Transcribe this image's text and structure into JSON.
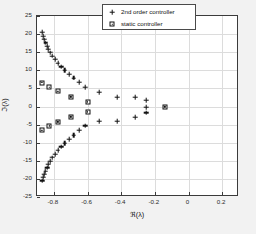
{
  "chart_data": {
    "type": "scatter",
    "title": "",
    "xlabel": "ℜ(λ)",
    "ylabel": "ℑ(λ)",
    "xlim": [
      -0.9,
      0.3
    ],
    "ylim": [
      -25,
      25
    ],
    "xticks": [
      -0.8,
      -0.6,
      -0.4,
      -0.2,
      0,
      0.2
    ],
    "xtick_labels": [
      "-0.8",
      "-0.6",
      "-0.4",
      "-0.2",
      "0",
      "0.2"
    ],
    "yticks": [
      -25,
      -20,
      -15,
      -10,
      -5,
      0,
      5,
      10,
      15,
      20,
      25
    ],
    "ytick_labels": [
      "-25",
      "-20",
      "-15",
      "-10",
      "-5",
      "0",
      "5",
      "10",
      "15",
      "20",
      "25"
    ],
    "grid": true,
    "legend_position": "top-right",
    "series": [
      {
        "name": "2nd order controller",
        "marker": "plus",
        "color": "#111111",
        "points": [
          [
            -0.868,
            20.6
          ],
          [
            -0.862,
            19.4
          ],
          [
            -0.856,
            18.5
          ],
          [
            -0.849,
            17.6
          ],
          [
            -0.841,
            16.7
          ],
          [
            -0.832,
            15.8
          ],
          [
            -0.821,
            14.9
          ],
          [
            -0.808,
            14.0
          ],
          [
            -0.793,
            13.0
          ],
          [
            -0.776,
            12.0
          ],
          [
            -0.757,
            11.0
          ],
          [
            -0.735,
            10.0
          ],
          [
            -0.71,
            9.0
          ],
          [
            -0.682,
            7.9
          ],
          [
            -0.65,
            6.7
          ],
          [
            -0.612,
            5.3
          ],
          [
            -0.53,
            4.0
          ],
          [
            -0.425,
            2.6
          ],
          [
            -0.315,
            2.6
          ],
          [
            -0.25,
            1.7
          ],
          [
            -0.25,
            -0.2
          ],
          [
            -0.25,
            -1.7
          ],
          [
            -0.315,
            -2.9
          ],
          [
            -0.425,
            -4.1
          ],
          [
            -0.53,
            -4.1
          ],
          [
            -0.612,
            -5.3
          ],
          [
            -0.65,
            -6.6
          ],
          [
            -0.682,
            -7.9
          ],
          [
            -0.71,
            -9.1
          ],
          [
            -0.735,
            -10.1
          ],
          [
            -0.757,
            -11.1
          ],
          [
            -0.776,
            -12.1
          ],
          [
            -0.793,
            -13.1
          ],
          [
            -0.808,
            -14.1
          ],
          [
            -0.821,
            -15.1
          ],
          [
            -0.832,
            -16.0
          ],
          [
            -0.841,
            -16.9
          ],
          [
            -0.849,
            -17.8
          ],
          [
            -0.856,
            -18.7
          ],
          [
            -0.862,
            -19.6
          ],
          [
            -0.868,
            -20.5
          ]
        ]
      },
      {
        "name": "static controller",
        "marker": "square",
        "color": "#111111",
        "points": [
          [
            -0.872,
            6.6
          ],
          [
            -0.828,
            5.3
          ],
          [
            -0.776,
            4.2
          ],
          [
            -0.7,
            2.7
          ],
          [
            -0.6,
            1.3
          ],
          [
            -0.6,
            -1.5
          ],
          [
            -0.7,
            -2.9
          ],
          [
            -0.776,
            -4.2
          ],
          [
            -0.828,
            -5.3
          ],
          [
            -0.872,
            -6.5
          ],
          [
            -0.14,
            -0.1
          ]
        ]
      }
    ]
  },
  "legend": {
    "entries": [
      {
        "label": "2nd order controller",
        "marker": "plus"
      },
      {
        "label": "static controller",
        "marker": "square"
      }
    ]
  }
}
